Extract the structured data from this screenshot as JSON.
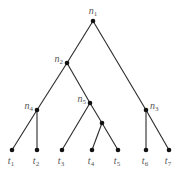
{
  "diagram": {
    "type": "rooted binary tree",
    "colors": {
      "edge": "#2a2a2a",
      "node": "#111111",
      "label": "#555555",
      "background": "#ffffff"
    },
    "nodes": [
      {
        "id": "n1",
        "base": "n",
        "sub": "1",
        "x": 93,
        "y": 21,
        "kind": "internal",
        "label_pos": "above"
      },
      {
        "id": "n2",
        "base": "n",
        "sub": "2",
        "x": 67,
        "y": 63,
        "kind": "internal",
        "label_pos": "left"
      },
      {
        "id": "n4",
        "base": "n",
        "sub": "4",
        "x": 37,
        "y": 110,
        "kind": "internal",
        "label_pos": "left"
      },
      {
        "id": "n5",
        "base": "n",
        "sub": "5",
        "x": 90,
        "y": 103,
        "kind": "internal",
        "label_pos": "left"
      },
      {
        "id": "u1",
        "base": "",
        "sub": "",
        "x": 102,
        "y": 123,
        "kind": "internal",
        "label_pos": "none"
      },
      {
        "id": "n3",
        "base": "n",
        "sub": "3",
        "x": 146,
        "y": 110,
        "kind": "internal",
        "label_pos": "right"
      },
      {
        "id": "t1",
        "base": "t",
        "sub": "1",
        "x": 12,
        "y": 150,
        "kind": "leaf",
        "label_pos": "below"
      },
      {
        "id": "t2",
        "base": "t",
        "sub": "2",
        "x": 37,
        "y": 150,
        "kind": "leaf",
        "label_pos": "below"
      },
      {
        "id": "t3",
        "base": "t",
        "sub": "3",
        "x": 62,
        "y": 150,
        "kind": "leaf",
        "label_pos": "below"
      },
      {
        "id": "t4",
        "base": "t",
        "sub": "4",
        "x": 92,
        "y": 150,
        "kind": "leaf",
        "label_pos": "below"
      },
      {
        "id": "t5",
        "base": "t",
        "sub": "5",
        "x": 118,
        "y": 150,
        "kind": "leaf",
        "label_pos": "below"
      },
      {
        "id": "t6",
        "base": "t",
        "sub": "6",
        "x": 146,
        "y": 150,
        "kind": "leaf",
        "label_pos": "below"
      },
      {
        "id": "t7",
        "base": "t",
        "sub": "7",
        "x": 169,
        "y": 150,
        "kind": "leaf",
        "label_pos": "below"
      }
    ],
    "edges": [
      [
        "n1",
        "n2"
      ],
      [
        "n1",
        "n3"
      ],
      [
        "n2",
        "n4"
      ],
      [
        "n2",
        "n5"
      ],
      [
        "n4",
        "t1"
      ],
      [
        "n4",
        "t2"
      ],
      [
        "n5",
        "t3"
      ],
      [
        "n5",
        "u1"
      ],
      [
        "u1",
        "t4"
      ],
      [
        "u1",
        "t5"
      ],
      [
        "n3",
        "t6"
      ],
      [
        "n3",
        "t7"
      ]
    ]
  }
}
